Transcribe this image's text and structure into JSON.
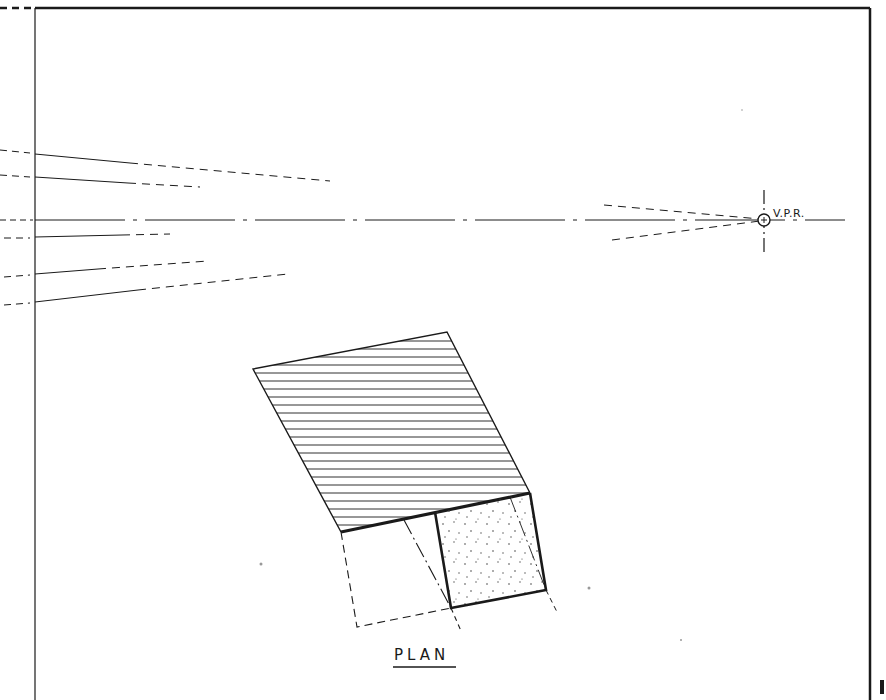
{
  "drawing": {
    "title": "Perspective construction from plan",
    "colors": {
      "ink": "#1a1a1a",
      "paper": "#ffffff",
      "stipple": "#444444"
    },
    "labels": {
      "vanishing_point": "V.P.R.",
      "plan": "PLAN"
    },
    "vanishing_point": {
      "x": 764,
      "y": 220,
      "label": "V.P.R."
    },
    "horizon_y": 220,
    "left_border_x": 35,
    "top_border_y": 8,
    "right_border_x": 870,
    "converging_lines_left_y": [
      154,
      177,
      220,
      237,
      274,
      302
    ],
    "plan_shapes": {
      "hatched_plane": [
        [
          253,
          369
        ],
        [
          447,
          332
        ],
        [
          530,
          493
        ],
        [
          341,
          532
        ]
      ],
      "stippled_square": [
        [
          435,
          512
        ],
        [
          530,
          493
        ],
        [
          546,
          590
        ],
        [
          451,
          608
        ]
      ],
      "dashed_rectangle": [
        [
          341,
          532
        ],
        [
          357,
          627
        ],
        [
          451,
          608
        ]
      ],
      "hatch_line_count": 24
    }
  }
}
